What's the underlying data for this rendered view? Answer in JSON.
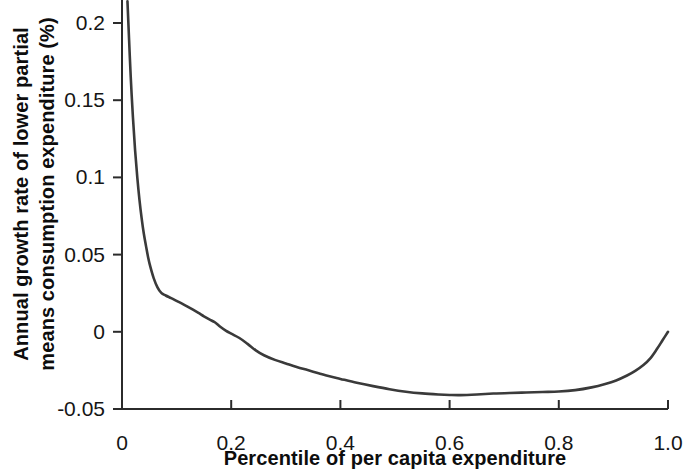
{
  "chart_data": {
    "type": "line",
    "title": "",
    "subtitle": "",
    "xlabel": "Percentile of per capita expenditure",
    "ylabel": "Annual growth rate of lower partial means consumption expenditure (%)",
    "ylabel_line1": "Annual growth rate of lower partial",
    "ylabel_line2": "means consumption expenditure (%)",
    "xlim": [
      0,
      1.0
    ],
    "ylim": [
      -0.05,
      0.21
    ],
    "grid": false,
    "legend": "none",
    "xticks": [
      "0",
      "0.2",
      "0.4",
      "0.6",
      "0.8",
      "1.0"
    ],
    "xtick_values": [
      0,
      0.2,
      0.4,
      0.6,
      0.8,
      1.0
    ],
    "yticks": [
      "0.2",
      "0.15",
      "0.1",
      "0.05",
      "0",
      "-0.05"
    ],
    "ytick_values": [
      0.2,
      0.15,
      0.1,
      0.05,
      0,
      -0.05
    ],
    "line_color": "#3a3a3a",
    "axis_color": "#2b2b2b",
    "series": [
      {
        "name": "Annual growth rate of lower partial means",
        "x": [
          0.01,
          0.013,
          0.016,
          0.02,
          0.024,
          0.028,
          0.032,
          0.036,
          0.04,
          0.044,
          0.048,
          0.052,
          0.058,
          0.065,
          0.072,
          0.08,
          0.09,
          0.1,
          0.11,
          0.12,
          0.13,
          0.14,
          0.15,
          0.16,
          0.17,
          0.18,
          0.19,
          0.2,
          0.215,
          0.23,
          0.245,
          0.26,
          0.28,
          0.3,
          0.32,
          0.34,
          0.36,
          0.38,
          0.4,
          0.43,
          0.46,
          0.49,
          0.52,
          0.55,
          0.58,
          0.6,
          0.62,
          0.65,
          0.68,
          0.71,
          0.74,
          0.77,
          0.8,
          0.83,
          0.86,
          0.885,
          0.905,
          0.925,
          0.94,
          0.955,
          0.968,
          0.98,
          0.99,
          1.0
        ],
        "y": [
          0.214,
          0.189,
          0.165,
          0.139,
          0.1175,
          0.1,
          0.0855,
          0.0735,
          0.0635,
          0.0555,
          0.048,
          0.042,
          0.0348,
          0.0288,
          0.0252,
          0.0235,
          0.0218,
          0.02,
          0.0182,
          0.0163,
          0.0143,
          0.0122,
          0.01,
          0.008,
          0.0062,
          0.0033,
          0.0008,
          -0.0012,
          -0.004,
          -0.0078,
          -0.012,
          -0.0152,
          -0.0182,
          -0.0205,
          -0.0228,
          -0.0248,
          -0.0268,
          -0.0288,
          -0.0305,
          -0.033,
          -0.0352,
          -0.0372,
          -0.0388,
          -0.0399,
          -0.0406,
          -0.0409,
          -0.041,
          -0.0406,
          -0.04,
          -0.0396,
          -0.0393,
          -0.039,
          -0.0387,
          -0.0378,
          -0.036,
          -0.0338,
          -0.0315,
          -0.0283,
          -0.0253,
          -0.0215,
          -0.017,
          -0.011,
          -0.0055,
          0.0
        ]
      }
    ],
    "annotations": [
      "Curve is clipped at the top of the axes above y = 0.21",
      "Steep decline from the first percentile to about the 5th percentile",
      "Crosses zero near the 18th percentile",
      "Minimum of about -0.041 near the 60th-62nd percentile",
      "Rises back to about 0 at the 100th percentile"
    ]
  },
  "axes": {
    "x_axis_label": "Percentile of per capita expenditure",
    "y_axis_label_line1": "Annual growth rate of lower partial",
    "y_axis_label_line2": "means consumption expenditure (%)"
  }
}
